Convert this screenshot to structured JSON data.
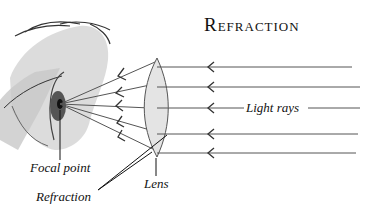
{
  "title": "Refraction",
  "labels": {
    "light_rays": "Light rays",
    "focal_point": "Focal point",
    "lens": "Lens",
    "refraction": "Refraction"
  },
  "colors": {
    "line": "#444444",
    "lens_fill": "#e4e4e4",
    "face_shade": "#cfcfcf",
    "text": "#111111"
  },
  "rays": [
    {
      "y": 67
    },
    {
      "y": 87
    },
    {
      "y": 108
    },
    {
      "y": 134
    },
    {
      "y": 153
    }
  ]
}
